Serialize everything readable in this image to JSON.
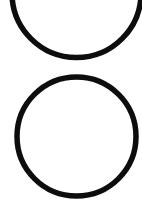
{
  "canvas": {
    "width": 142,
    "height": 218,
    "background_color": "#ffffff",
    "description": "two-circle-outlines"
  },
  "chart_data": {
    "type": "scatter",
    "title": "",
    "subtitle": "",
    "xlabel": "",
    "ylabel": "",
    "grid": false,
    "legend": null,
    "xlim": [
      0,
      142
    ],
    "ylim": [
      0,
      218
    ],
    "shapes": [
      {
        "name": "upper-circle",
        "type": "circle",
        "cx": 76.5,
        "cy": -7,
        "r": 64.5,
        "stroke_color": "#0d0d0d",
        "stroke_width": 5.5,
        "fill": "none",
        "clipped": true,
        "clipped_edge": "top"
      },
      {
        "name": "lower-circle",
        "type": "circle",
        "cx": 76.5,
        "cy": 136.5,
        "r": 59.5,
        "stroke_color": "#0d0d0d",
        "stroke_width": 5.5,
        "fill": "none",
        "clipped": false,
        "clipped_edge": ""
      }
    ]
  }
}
